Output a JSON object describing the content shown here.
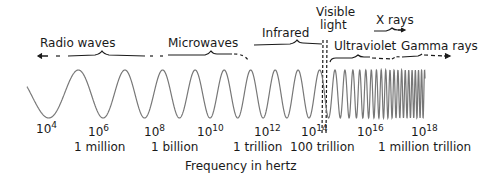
{
  "diagram": {
    "bands": [
      {
        "label": "Radio waves",
        "x": 40,
        "y": 36
      },
      {
        "label": "Microwaves",
        "x": 168,
        "y": 36
      },
      {
        "label": "Infrared",
        "x": 262,
        "y": 27
      },
      {
        "label": "Visible",
        "x": 316,
        "y": 5
      },
      {
        "label": "light",
        "x": 320,
        "y": 18
      },
      {
        "label": "X rays",
        "x": 375,
        "y": 14
      },
      {
        "label": "Ultraviolet",
        "x": 335,
        "y": 40
      },
      {
        "label": "Gamma rays",
        "x": 402,
        "y": 40
      }
    ],
    "ticks": [
      {
        "base": "10",
        "exp": "4",
        "x": 36,
        "y": 118
      },
      {
        "base": "10",
        "exp": "6",
        "x": 88,
        "y": 122
      },
      {
        "base": "10",
        "exp": "8",
        "x": 144,
        "y": 122
      },
      {
        "base": "10",
        "exp": "10",
        "x": 198,
        "y": 122
      },
      {
        "base": "10",
        "exp": "12",
        "x": 254,
        "y": 122
      },
      {
        "base": "10",
        "exp": "14",
        "x": 302,
        "y": 122
      },
      {
        "base": "10",
        "exp": "16",
        "x": 356,
        "y": 122
      },
      {
        "base": "10",
        "exp": "18",
        "x": 410,
        "y": 122
      }
    ],
    "tick_names": [
      {
        "label": "1 million",
        "x": 74,
        "y": 142
      },
      {
        "label": "1 billion",
        "x": 150,
        "y": 142
      },
      {
        "label": "1 trillion",
        "x": 232,
        "y": 142
      },
      {
        "label": "100 trillion",
        "x": 288,
        "y": 142
      },
      {
        "label": "1 million trillion",
        "x": 376,
        "y": 142
      }
    ],
    "axis_label": {
      "label": "Frequency in hertz",
      "x": 185,
      "y": 161
    }
  },
  "colors": {
    "ink": "#1a1a1a",
    "wave": "#777777"
  }
}
